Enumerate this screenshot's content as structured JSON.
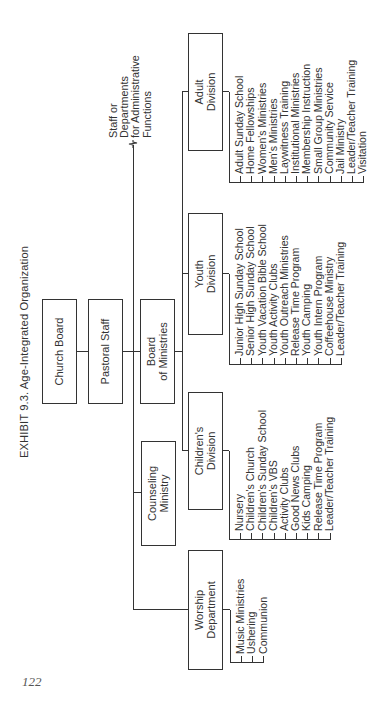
{
  "exhibit_title": "EXHIBIT 9.3. Age-Integrated Organization",
  "page_number": "122",
  "staff_note": {
    "lines": [
      "Staff or",
      "Departments",
      "for Administrative",
      "Functions"
    ]
  },
  "nodes": {
    "church_board": "Church Board",
    "pastoral_staff": "Pastoral Staff",
    "board_of_ministries": {
      "line1": "Board",
      "line2": "of Ministries"
    },
    "counseling_ministry": {
      "line1": "Counseling",
      "line2": "Ministry"
    }
  },
  "divisions": [
    {
      "key": "adult",
      "line1": "Adult",
      "line2": "Division",
      "items": [
        "Adult Sunday School",
        "Home Fellowships",
        "Women's Ministries",
        "Men's Ministries",
        "Laywitness Training",
        "Institutional Ministries",
        "Membership Instruction",
        "Small Group Ministries",
        "Community Service",
        "Jail Ministry",
        "Leader/Teacher Training",
        "Visitation"
      ]
    },
    {
      "key": "youth",
      "line1": "Youth",
      "line2": "Division",
      "items": [
        "Junior High Sunday School",
        "Senior High Sunday School",
        "Youth Vacation Bible School",
        "Youth Activity Clubs",
        "Youth Outreach Ministries",
        "Release Time Program",
        "Youth Camping",
        "Youth Intern Program",
        "Coffeehouse Ministry",
        "Leader/Teacher Training"
      ]
    },
    {
      "key": "children",
      "line1": "Children's",
      "line2": "Division",
      "items": [
        "Nursery",
        "Children's Church",
        "Children's Sunday School",
        "Children's VBS",
        "Activity Clubs",
        "Good News Clubs",
        "Kids Camping",
        "Release Time Program",
        "Leader/Teacher Training"
      ]
    },
    {
      "key": "worship",
      "line1": "Worship",
      "line2": "Department",
      "items": [
        "Music Ministries",
        "Ushering",
        "Communion"
      ]
    }
  ]
}
